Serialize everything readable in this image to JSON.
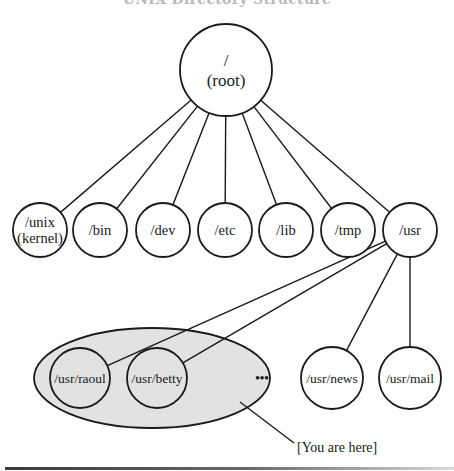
{
  "title": "UNIX Directory Structure",
  "annotation": {
    "label": "[You are here]",
    "x": 297,
    "y": 452,
    "line": [
      240,
      402,
      294,
      443
    ]
  },
  "ellipse": {
    "cx": 152,
    "cy": 378,
    "rx": 118,
    "ry": 50
  },
  "ellipsis": {
    "label": "•••",
    "x": 262,
    "y": 382
  },
  "root": {
    "id": "root",
    "lines": [
      "/",
      "(root)"
    ],
    "cx": 226,
    "cy": 70,
    "r": 46
  },
  "level1": [
    {
      "id": "unix",
      "lines": [
        "/unix",
        "(kernel)"
      ],
      "cx": 40,
      "cy": 230,
      "r": 27
    },
    {
      "id": "bin",
      "lines": [
        "/bin"
      ],
      "cx": 100,
      "cy": 230,
      "r": 27
    },
    {
      "id": "dev",
      "lines": [
        "/dev"
      ],
      "cx": 163,
      "cy": 230,
      "r": 27
    },
    {
      "id": "etc",
      "lines": [
        "/etc"
      ],
      "cx": 225,
      "cy": 230,
      "r": 27
    },
    {
      "id": "lib",
      "lines": [
        "/lib"
      ],
      "cx": 286,
      "cy": 230,
      "r": 27
    },
    {
      "id": "tmp",
      "lines": [
        "/tmp"
      ],
      "cx": 348,
      "cy": 230,
      "r": 27
    },
    {
      "id": "usr",
      "lines": [
        "/usr"
      ],
      "cx": 410,
      "cy": 230,
      "r": 27
    }
  ],
  "level2": [
    {
      "id": "usr-raoul",
      "lines": [
        "/usr/raoul"
      ],
      "cx": 80,
      "cy": 378,
      "r": 30,
      "shaded": true
    },
    {
      "id": "usr-betty",
      "lines": [
        "/usr/betty"
      ],
      "cx": 157,
      "cy": 378,
      "r": 30,
      "shaded": true
    },
    {
      "id": "usr-news",
      "lines": [
        "/usr/news"
      ],
      "cx": 332,
      "cy": 378,
      "r": 31,
      "shaded": false
    },
    {
      "id": "usr-mail",
      "lines": [
        "/usr/mail"
      ],
      "cx": 410,
      "cy": 378,
      "r": 31,
      "shaded": false
    }
  ],
  "edges": [
    {
      "from": "root",
      "to": "unix"
    },
    {
      "from": "root",
      "to": "bin"
    },
    {
      "from": "root",
      "to": "dev"
    },
    {
      "from": "root",
      "to": "etc"
    },
    {
      "from": "root",
      "to": "lib"
    },
    {
      "from": "root",
      "to": "tmp"
    },
    {
      "from": "root",
      "to": "usr"
    },
    {
      "from": "usr",
      "to": "usr-raoul"
    },
    {
      "from": "usr",
      "to": "usr-betty"
    },
    {
      "from": "usr",
      "to": "usr-news"
    },
    {
      "from": "usr",
      "to": "usr-mail"
    }
  ]
}
